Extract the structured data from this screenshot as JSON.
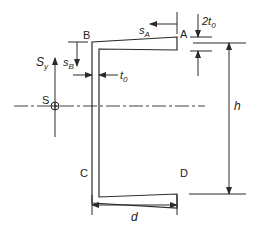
{
  "diagram": {
    "points": {
      "A": "A",
      "B": "B",
      "C": "C",
      "D": "D",
      "S": "S"
    },
    "labels": {
      "shear_force": "S",
      "shear_force_sub": "y",
      "s_A": "s",
      "s_A_sub": "A",
      "s_B": "s",
      "s_B_sub": "B",
      "web_thickness": "t",
      "web_thickness_sub": "0",
      "flange_tip_thickness_prefix": "2t",
      "flange_tip_thickness_sub": "0",
      "height": "h",
      "depth": "d"
    },
    "colors": {
      "line": "#2a2a2a",
      "background": "#ffffff"
    }
  }
}
